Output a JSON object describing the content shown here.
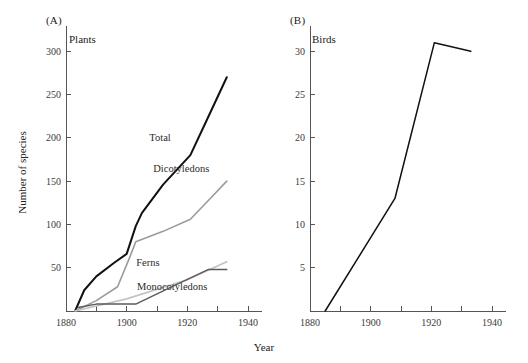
{
  "figure": {
    "shared_x_axis_label": "Year",
    "y_axis_label_a": "Number of species",
    "colors": {
      "total": "#111111",
      "dicotyledons": "#9b9b9b",
      "monocotyledons": "#c2c2c2",
      "ferns": "#5a5a5a",
      "birds": "#111111",
      "axis": "#555555",
      "text": "#222222"
    }
  },
  "panels": [
    {
      "letter": "(A)",
      "title": "Plants",
      "y_axis_label": "Number of species",
      "x_axis_label": "Year"
    },
    {
      "letter": "(B)",
      "title": "Birds",
      "y_axis_label": "",
      "x_axis_label": "Year"
    }
  ],
  "chart_data": [
    {
      "type": "line",
      "title": "Plants",
      "panel": "(A)",
      "xlabel": "Year",
      "ylabel": "Number of species",
      "xlim": [
        1880,
        1940
      ],
      "ylim": [
        0,
        320
      ],
      "xticks": [
        1880,
        1890,
        1900,
        1910,
        1920,
        1930,
        1940
      ],
      "xtick_labels": [
        "1880",
        "",
        "1900",
        "",
        "1920",
        "",
        "1940"
      ],
      "yticks": [
        50,
        100,
        150,
        200,
        250,
        300
      ],
      "ytick_labels": [
        "50",
        "100",
        "150",
        "200",
        "250",
        "300"
      ],
      "grid": false,
      "legend": "inline-labels",
      "series": [
        {
          "name": "Total",
          "color": "#111111",
          "linewidth": 2.0,
          "label_position": {
            "x": 1911,
            "y": 196
          },
          "x": [
            1883,
            1886,
            1890,
            1896,
            1900,
            1903,
            1905,
            1912,
            1921,
            1927,
            1933
          ],
          "values": [
            0,
            24,
            40,
            56,
            66,
            98,
            113,
            146,
            180,
            225,
            270
          ]
        },
        {
          "name": "Dicotyledons",
          "color": "#9b9b9b",
          "linewidth": 1.6,
          "label_position": {
            "x": 1918,
            "y": 161
          },
          "x": [
            1883,
            1890,
            1897,
            1901,
            1903,
            1912,
            1921,
            1927,
            1933
          ],
          "values": [
            0,
            12,
            28,
            62,
            80,
            92,
            106,
            128,
            150
          ]
        },
        {
          "name": "Monocotyledons",
          "color": "#c2c2c2",
          "linewidth": 1.6,
          "label_position": {
            "x": 1915,
            "y": 24
          },
          "x": [
            1883,
            1900,
            1920,
            1933
          ],
          "values": [
            0,
            14,
            36,
            57
          ]
        },
        {
          "name": "Ferns",
          "color": "#5a5a5a",
          "linewidth": 1.4,
          "label_position": {
            "x": 1907,
            "y": 52
          },
          "x": [
            1884,
            1890,
            1903,
            1916,
            1927,
            1933
          ],
          "values": [
            4,
            8,
            8,
            30,
            48,
            48
          ]
        }
      ]
    },
    {
      "type": "line",
      "title": "Birds",
      "panel": "(B)",
      "xlabel": "Year",
      "ylabel": "",
      "xlim": [
        1880,
        1940
      ],
      "ylim": [
        0,
        32
      ],
      "xticks": [
        1880,
        1890,
        1900,
        1910,
        1920,
        1930,
        1940
      ],
      "xtick_labels": [
        "1880",
        "",
        "1900",
        "",
        "1920",
        "",
        "1940"
      ],
      "yticks": [
        5,
        10,
        15,
        20,
        25,
        30
      ],
      "ytick_labels": [
        "5",
        "10",
        "15",
        "20",
        "25",
        "30"
      ],
      "grid": false,
      "legend": "none",
      "series": [
        {
          "name": "Birds",
          "color": "#111111",
          "linewidth": 1.5,
          "x": [
            1885,
            1908,
            1921,
            1933
          ],
          "values": [
            0,
            13,
            31,
            30
          ]
        }
      ]
    }
  ]
}
